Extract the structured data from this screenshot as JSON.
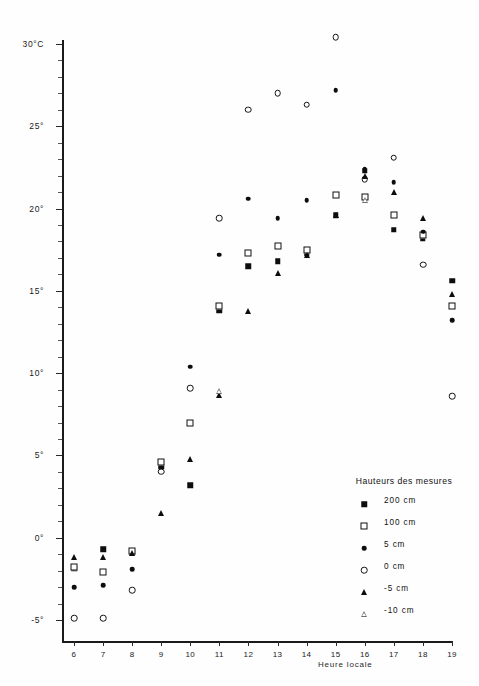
{
  "chart_data": {
    "type": "scatter",
    "title": "",
    "xlabel": "Heure locale",
    "ylabel": "30°C",
    "xlim": [
      5.5,
      19.5
    ],
    "ylim": [
      -6,
      31
    ],
    "grid": false,
    "legend_position": "bottom-right",
    "x": [
      6,
      7,
      8,
      9,
      10,
      11,
      12,
      13,
      14,
      15,
      16,
      17,
      18,
      19
    ],
    "xtick_labels": [
      "6",
      "7",
      "8",
      "9",
      "10",
      "11",
      "12",
      "13",
      "14",
      "15",
      "16",
      "17",
      "18",
      "19"
    ],
    "ytick_labels": [
      "30°C",
      "25°",
      "20°",
      "15°",
      "10°",
      "5°",
      "0°",
      "-5°"
    ],
    "ytick_values": [
      30,
      25,
      20,
      15,
      10,
      5,
      0,
      -5
    ],
    "series": [
      {
        "name": "200 cm",
        "marker": "filled-square",
        "x": [
          6,
          7,
          8,
          9,
          10,
          11,
          12,
          13,
          14,
          15,
          16,
          17,
          18,
          19
        ],
        "values": [
          -1.9,
          -0.7,
          -0.9,
          4.3,
          3.2,
          13.8,
          16.5,
          16.8,
          17.3,
          19.6,
          22.3,
          18.7,
          18.2,
          15.6
        ]
      },
      {
        "name": "100 cm",
        "marker": "open-square",
        "x": [
          6,
          7,
          8,
          9,
          10,
          11,
          12,
          13,
          14,
          15,
          16,
          17,
          18,
          19
        ],
        "values": [
          -1.8,
          -2.1,
          -0.8,
          4.6,
          7.0,
          14.1,
          17.3,
          17.7,
          17.5,
          20.8,
          20.7,
          19.6,
          18.4,
          14.1
        ]
      },
      {
        "name": "5 cm",
        "marker": "filled-circle",
        "x": [
          6,
          7,
          8,
          9,
          10,
          11,
          12,
          13,
          14,
          15,
          16,
          17,
          18,
          19
        ],
        "values": [
          -3.0,
          -2.9,
          -1.9,
          4.0,
          10.4,
          17.2,
          20.6,
          19.4,
          20.5,
          27.2,
          22.4,
          21.6,
          18.6,
          13.2
        ]
      },
      {
        "name": "0 cm",
        "marker": "open-circle",
        "x": [
          6,
          7,
          8,
          9,
          10,
          11,
          12,
          13,
          14,
          15,
          16,
          17,
          18,
          19
        ],
        "values": [
          -4.9,
          -4.9,
          -3.2,
          4.0,
          9.1,
          19.4,
          26.0,
          27.0,
          26.3,
          30.4,
          21.8,
          23.1,
          16.6,
          8.6
        ]
      },
      {
        "name": "-5 cm",
        "marker": "filled-triangle",
        "x": [
          6,
          7,
          8,
          9,
          10,
          11,
          12,
          13,
          14,
          15,
          16,
          17,
          18,
          19
        ],
        "values": [
          -1.2,
          -1.2,
          -0.9,
          1.5,
          4.8,
          8.7,
          13.8,
          16.1,
          17.2,
          19.6,
          22.0,
          21.0,
          19.4,
          14.8
        ]
      },
      {
        "name": "-10 cm",
        "marker": "open-triangle",
        "x": [
          11,
          16
        ],
        "values": [
          8.9,
          20.5
        ]
      }
    ]
  },
  "legend": {
    "title": "Hauteurs des mesures",
    "items": [
      {
        "label": "200 cm",
        "marker": "filled-square"
      },
      {
        "label": "100 cm",
        "marker": "open-square"
      },
      {
        "label": "5 cm",
        "marker": "filled-circle"
      },
      {
        "label": "0 cm",
        "marker": "open-circle"
      },
      {
        "label": "-5 cm",
        "marker": "filled-triangle"
      },
      {
        "label": "-10 cm",
        "marker": "open-triangle"
      }
    ]
  },
  "colors": {
    "ink": "#0d0d0d",
    "axis": "#1a1a1a",
    "background": "#ffffff"
  }
}
